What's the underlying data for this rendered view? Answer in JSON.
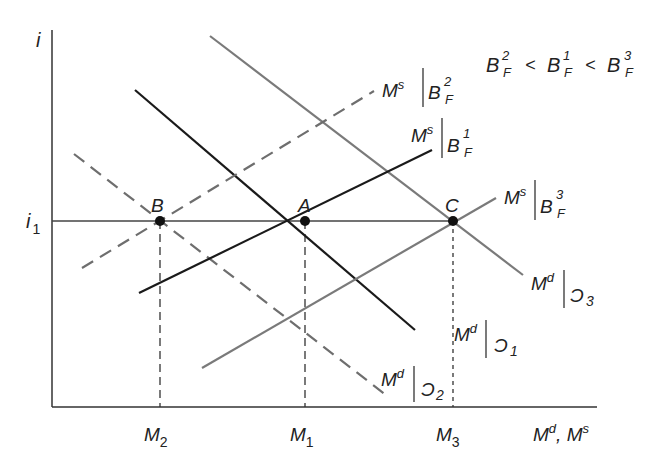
{
  "diagram": {
    "title": "",
    "axes": {
      "y_label": "i",
      "x_label_main": "M",
      "x_label_sup1": "d",
      "x_label_sep": ", ",
      "x_label_main2": "M",
      "x_label_sup2": "s",
      "i1_label": "i",
      "i1_sub": "1"
    },
    "x_ticks": [
      {
        "label": "M",
        "sub": "2"
      },
      {
        "label": "M",
        "sub": "1"
      },
      {
        "label": "M",
        "sub": "3"
      }
    ],
    "points": [
      {
        "label": "B"
      },
      {
        "label": "A"
      },
      {
        "label": "C"
      }
    ],
    "ordering": {
      "b1": "B",
      "b1_sup": "2",
      "b1_sub": "F",
      "lt1": "<",
      "b2": "B",
      "b2_sup": "1",
      "b2_sub": "F",
      "lt2": "<",
      "b3": "B",
      "b3_sup": "3",
      "b3_sub": "F"
    },
    "curves": {
      "ms2": {
        "main": "M",
        "sup": "s",
        "cond": "B",
        "cond_sup": "2",
        "cond_sub": "F",
        "style": "dashed",
        "color": "#6e6e6e"
      },
      "ms1": {
        "main": "M",
        "sup": "s",
        "cond": "B",
        "cond_sup": "1",
        "cond_sub": "F",
        "style": "solid",
        "color": "#1a1a1a"
      },
      "ms3": {
        "main": "M",
        "sup": "s",
        "cond": "B",
        "cond_sup": "3",
        "cond_sub": "F",
        "style": "solid",
        "color": "#7a7a7a"
      },
      "md3": {
        "main": "M",
        "sup": "d",
        "cond": "Ɔ",
        "cond_sub": "3",
        "style": "solid",
        "color": "#7a7a7a"
      },
      "md1": {
        "main": "M",
        "sup": "d",
        "cond": "Ɔ",
        "cond_sub": "1",
        "style": "solid",
        "color": "#1a1a1a"
      },
      "md2": {
        "main": "M",
        "sup": "d",
        "cond": "Ɔ",
        "cond_sub": "2",
        "style": "dashed",
        "color": "#6e6e6e"
      }
    }
  }
}
